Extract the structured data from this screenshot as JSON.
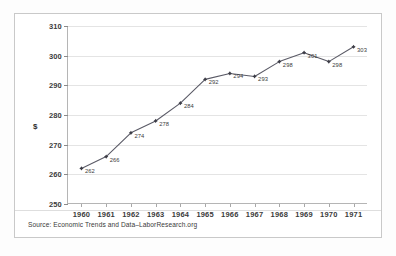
{
  "chart_data": {
    "type": "line",
    "title": "",
    "xlabel": "",
    "ylabel": "$",
    "categories": [
      "1960",
      "1961",
      "1962",
      "1963",
      "1964",
      "1965",
      "1966",
      "1967",
      "1968",
      "1969",
      "1970",
      "1971"
    ],
    "values": [
      262,
      266,
      274,
      278,
      284,
      292,
      294,
      293,
      298,
      301,
      298,
      303
    ],
    "point_labels": [
      "262",
      "266",
      "274",
      "278",
      "284",
      "292",
      "294",
      "293",
      "298",
      "301",
      "298",
      "303"
    ],
    "ylim": [
      250,
      310
    ],
    "ytick_labels": [
      "250",
      "260",
      "270",
      "280",
      "290",
      "300",
      "310"
    ],
    "ytick_values": [
      250,
      260,
      270,
      280,
      290,
      300,
      310
    ],
    "grid": true,
    "legend": "none",
    "series": [
      {
        "name": "",
        "values": [
          262,
          266,
          274,
          278,
          284,
          292,
          294,
          293,
          298,
          301,
          298,
          303
        ]
      }
    ],
    "annotations": {
      "source": "Source: Economic Trends and Data–LaborResearch.org"
    },
    "colors": {
      "line": "#5a5a66",
      "marker": "#3c3c46",
      "grid": "#e4e4e4",
      "axis": "#b5b5b5",
      "text": "#3b3b3b",
      "background": "#ffffff",
      "frame": "#c9c9c9"
    }
  }
}
